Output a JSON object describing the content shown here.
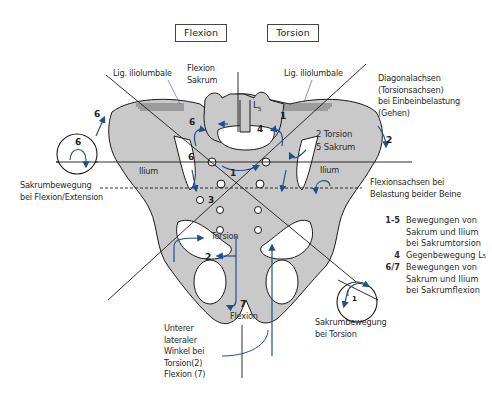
{
  "header": {
    "flexion_box": "Flexion",
    "torsion_box": "Torsion"
  },
  "labels": {
    "lig_left": "Lig. iliolumbale",
    "lig_right": "Lig. iliolumbale",
    "flexion_sakrum": [
      "Flexion",
      "Sakrum"
    ],
    "diagonal_axes": [
      "Diagonalachsen",
      "(Torsionsachsen)",
      "bei Einbeinbelastung",
      "(Gehen)"
    ],
    "ilium_left": "Ilium",
    "ilium_right": "Ilium",
    "torsion_right": [
      "2 Torsion",
      "5 Sakrum"
    ],
    "flexion_axes": [
      "Flexionsachsen bei",
      "Belastung beider Beine"
    ],
    "sakrum_flex_ext": [
      "Sakrumbewegung",
      "bei Flexion/Extension"
    ],
    "sakrum_torsion": [
      "Sakrumbewegung",
      "bei Torsion"
    ],
    "torsion_center": "Torsion",
    "flexion_bottom": "Flexion",
    "lower_angle": [
      "Unterer",
      "lateraler",
      "Winkel bei",
      "Torsion(2)",
      "Flexion (7)"
    ],
    "l5": "L",
    "l5_sub": "5"
  },
  "numbers": {
    "n6_outer": "6",
    "n6_circle": "6",
    "n6_upper": "6",
    "n6_lower": "6",
    "n1_top": "1",
    "n4": "4",
    "n1_center": "1",
    "n3": "3",
    "n2_lower": "2",
    "n7": "7",
    "n2_right": "2",
    "n1_circle": "1"
  },
  "legend": [
    {
      "key": "1-5",
      "lines": [
        "Bewegungen von",
        "Sakrum und Ilium",
        "bei Sakrumtorsion"
      ]
    },
    {
      "key": "4",
      "lines": [
        "Gegenbewegung L₅"
      ]
    },
    {
      "key": "6/7",
      "lines": [
        "Bewegungen von",
        "Sakrum und Ilium",
        "bei Sakrumflexion"
      ]
    }
  ],
  "colors": {
    "bone_fill": "#c9c9c9",
    "outline": "#1a1a1a",
    "arrow_blue": "#1f4f93",
    "text": "#2b2b2b"
  }
}
